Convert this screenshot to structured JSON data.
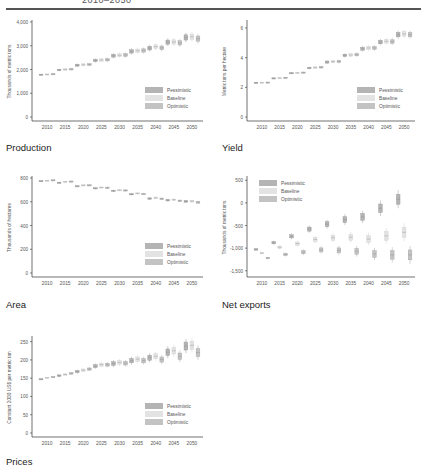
{
  "header": {
    "title": "2010–2050"
  },
  "legend": {
    "labels": [
      "Pessimistic",
      "Baseline",
      "Optimistic"
    ],
    "colors": {
      "Pessimistic": "#b4b4b4",
      "Baseline": "#e3e3e3",
      "Optimistic": "#c3c3c3"
    }
  },
  "captions": {
    "production": "Production",
    "yield": "Yield",
    "area": "Area",
    "net_exports": "Net exports",
    "prices": "Prices"
  },
  "chart_data": [
    {
      "id": "production",
      "type": "box",
      "title": "Production",
      "ylabel": "Thousands of metric tons",
      "ylim": [
        0,
        4000
      ],
      "yticks": [
        0,
        1000,
        2000,
        3000,
        4000
      ],
      "ytick_labels": [
        "0",
        "1,000",
        "2,000",
        "3,000",
        "4,000"
      ],
      "categories": [
        "2010",
        "2015",
        "2020",
        "2025",
        "2030",
        "2035",
        "2040",
        "2045",
        "2050"
      ],
      "legend_position": "bottom-right",
      "series": [
        {
          "name": "Pessimistic",
          "median": [
            1780,
            1980,
            2180,
            2380,
            2580,
            2760,
            2900,
            3150,
            3350
          ],
          "spread": [
            20,
            30,
            40,
            50,
            60,
            70,
            80,
            90,
            110
          ]
        },
        {
          "name": "Baseline",
          "median": [
            1790,
            2000,
            2200,
            2400,
            2600,
            2790,
            2960,
            3160,
            3380
          ],
          "spread": [
            20,
            30,
            40,
            50,
            60,
            70,
            80,
            90,
            110
          ]
        },
        {
          "name": "Optimistic",
          "median": [
            1800,
            2010,
            2210,
            2410,
            2610,
            2800,
            2910,
            3120,
            3300
          ],
          "spread": [
            20,
            30,
            40,
            50,
            60,
            70,
            80,
            90,
            110
          ]
        }
      ]
    },
    {
      "id": "yield",
      "type": "box",
      "title": "Yield",
      "ylabel": "Metric tons per hectare",
      "ylim": [
        0,
        6.4
      ],
      "yticks": [
        0,
        2,
        4,
        6
      ],
      "ytick_labels": [
        "0",
        "2",
        "4",
        "6"
      ],
      "categories": [
        "2010",
        "2015",
        "2020",
        "2025",
        "2030",
        "2035",
        "2040",
        "2045",
        "2050"
      ],
      "legend_position": "bottom-right",
      "series": [
        {
          "name": "Pessimistic",
          "median": [
            2.3,
            2.6,
            2.95,
            3.3,
            3.7,
            4.15,
            4.6,
            5.05,
            5.55
          ],
          "spread": [
            0.02,
            0.03,
            0.04,
            0.05,
            0.07,
            0.08,
            0.1,
            0.12,
            0.15
          ]
        },
        {
          "name": "Baseline",
          "median": [
            2.31,
            2.62,
            2.97,
            3.33,
            3.73,
            4.18,
            4.65,
            5.1,
            5.6
          ],
          "spread": [
            0.02,
            0.03,
            0.04,
            0.05,
            0.07,
            0.08,
            0.1,
            0.12,
            0.15
          ]
        },
        {
          "name": "Optimistic",
          "median": [
            2.32,
            2.64,
            2.99,
            3.35,
            3.74,
            4.2,
            4.65,
            5.08,
            5.55
          ],
          "spread": [
            0.02,
            0.03,
            0.04,
            0.05,
            0.07,
            0.08,
            0.1,
            0.12,
            0.15
          ]
        }
      ]
    },
    {
      "id": "area",
      "type": "box",
      "title": "Area",
      "ylabel": "Thousands of hectares",
      "ylim": [
        0,
        800
      ],
      "yticks": [
        0,
        200,
        400,
        600,
        800
      ],
      "ytick_labels": [
        "0",
        "200",
        "400",
        "600",
        "800"
      ],
      "categories": [
        "2010",
        "2015",
        "2020",
        "2025",
        "2030",
        "2035",
        "2040",
        "2045",
        "2050"
      ],
      "legend_position": "bottom-right",
      "series": [
        {
          "name": "Pessimistic",
          "median": [
            773,
            760,
            730,
            713,
            692,
            663,
            627,
            613,
            603
          ],
          "spread": [
            3,
            4,
            4,
            5,
            5,
            5,
            6,
            6,
            7
          ]
        },
        {
          "name": "Baseline",
          "median": [
            777,
            768,
            738,
            720,
            697,
            670,
            633,
            617,
            605
          ],
          "spread": [
            3,
            4,
            4,
            5,
            5,
            5,
            6,
            6,
            7
          ]
        },
        {
          "name": "Optimistic",
          "median": [
            780,
            770,
            738,
            718,
            695,
            665,
            625,
            608,
            595
          ],
          "spread": [
            3,
            4,
            4,
            5,
            5,
            5,
            6,
            6,
            7
          ]
        }
      ]
    },
    {
      "id": "net_exports",
      "type": "box",
      "title": "Net exports",
      "ylabel": "Thousands of metric tons",
      "ylim": [
        -1550,
        550
      ],
      "yticks": [
        -1500,
        -1000,
        -500,
        0,
        500
      ],
      "ytick_labels": [
        "-1,500",
        "-1,000",
        "-500",
        "0",
        "500"
      ],
      "categories": [
        "2010",
        "2015",
        "2020",
        "2025",
        "2030",
        "2035",
        "2040",
        "2045",
        "2050"
      ],
      "legend_position": "top-left",
      "series": [
        {
          "name": "Pessimistic",
          "median": [
            -1030,
            -880,
            -740,
            -580,
            -470,
            -370,
            -310,
            -120,
            80
          ],
          "spread": [
            15,
            25,
            35,
            45,
            55,
            65,
            75,
            95,
            110
          ]
        },
        {
          "name": "Baseline",
          "median": [
            -1110,
            -980,
            -900,
            -810,
            -770,
            -760,
            -800,
            -730,
            -650
          ],
          "spread": [
            15,
            25,
            35,
            45,
            55,
            65,
            75,
            95,
            110
          ]
        },
        {
          "name": "Optimistic",
          "median": [
            -1220,
            -1140,
            -1090,
            -1040,
            -1050,
            -1070,
            -1130,
            -1150,
            -1150
          ],
          "spread": [
            15,
            25,
            35,
            45,
            55,
            65,
            75,
            95,
            110
          ]
        }
      ]
    },
    {
      "id": "prices",
      "type": "box",
      "title": "Prices",
      "ylabel": "Constant 2000 US$ per metric ton",
      "ylim": [
        0,
        260
      ],
      "yticks": [
        0,
        50,
        100,
        150,
        200,
        250
      ],
      "ytick_labels": [
        "0",
        "50",
        "100",
        "150",
        "200",
        "250"
      ],
      "categories": [
        "2010",
        "2015",
        "2020",
        "2025",
        "2030",
        "2035",
        "2040",
        "2045",
        "2050"
      ],
      "legend_position": "bottom-right",
      "series": [
        {
          "name": "Pessimistic",
          "median": [
            147,
            157,
            168,
            183,
            190,
            198,
            206,
            221,
            238
          ],
          "spread": [
            1,
            2,
            3,
            4,
            5,
            6,
            7,
            9,
            11
          ]
        },
        {
          "name": "Baseline",
          "median": [
            151,
            160,
            172,
            187,
            193,
            202,
            210,
            225,
            240
          ],
          "spread": [
            1,
            2,
            3,
            4,
            5,
            6,
            7,
            9,
            11
          ]
        },
        {
          "name": "Optimistic",
          "median": [
            153,
            163,
            175,
            187,
            191,
            198,
            201,
            210,
            220
          ],
          "spread": [
            1,
            2,
            3,
            4,
            5,
            6,
            7,
            9,
            11
          ]
        }
      ]
    }
  ]
}
